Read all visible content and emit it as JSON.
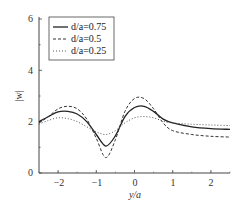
{
  "chart_data": {
    "type": "line",
    "title": "",
    "xlabel": "y/a",
    "ylabel": "|w|",
    "xlim": [
      -2.5,
      2.5
    ],
    "ylim": [
      0,
      6
    ],
    "xticks": [
      -2,
      -1,
      0,
      1,
      2
    ],
    "yticks": [
      0,
      2,
      4,
      6
    ],
    "grid": false,
    "legend_position": "upper left",
    "x": [
      -2.5,
      -2.25,
      -2.0,
      -1.75,
      -1.5,
      -1.25,
      -1.0,
      -0.75,
      -0.5,
      -0.25,
      0.0,
      0.25,
      0.5,
      0.75,
      1.0,
      1.5,
      2.0,
      2.5
    ],
    "series": [
      {
        "name": "d/a=0.75",
        "style": "solid",
        "values": [
          2.0,
          2.2,
          2.38,
          2.4,
          2.3,
          2.0,
          1.5,
          1.05,
          1.45,
          2.2,
          2.55,
          2.6,
          2.4,
          2.1,
          1.95,
          1.8,
          1.73,
          1.7
        ]
      },
      {
        "name": "d/a=0.5",
        "style": "dashed",
        "values": [
          1.95,
          2.2,
          2.5,
          2.6,
          2.5,
          2.1,
          1.35,
          0.6,
          1.3,
          2.4,
          2.9,
          2.9,
          2.5,
          1.95,
          1.65,
          1.5,
          1.43,
          1.4
        ]
      },
      {
        "name": "d/a=0.25",
        "style": "dotted",
        "values": [
          1.9,
          2.05,
          2.15,
          2.12,
          2.0,
          1.8,
          1.6,
          1.5,
          1.65,
          1.95,
          2.15,
          2.2,
          2.15,
          2.02,
          1.95,
          1.9,
          1.87,
          1.85
        ]
      }
    ]
  },
  "labels": {
    "xlabel": "y/a",
    "ylabel": "|w|",
    "yticks": [
      "0",
      "2",
      "4",
      "6"
    ],
    "xticks": [
      "−2",
      "−1",
      "0",
      "1",
      "2"
    ],
    "legend": [
      "d/a=0.75",
      "d/a=0.5",
      "d/a=0.25"
    ]
  }
}
